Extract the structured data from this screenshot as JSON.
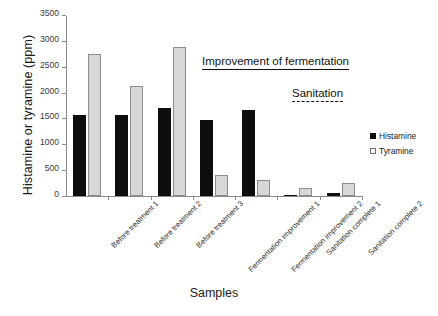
{
  "chart_data": {
    "type": "bar",
    "title": "",
    "xlabel": "Samples",
    "ylabel": "Histamine or tyramine  (ppm)",
    "ylim": [
      0,
      3500
    ],
    "ytick_step": 500,
    "yticks": [
      0,
      500,
      1000,
      1500,
      2000,
      2500,
      3000,
      3500
    ],
    "ytick_labels": [
      "0",
      "500",
      "1000",
      "1500",
      "2000",
      "2500",
      "3000",
      "3500"
    ],
    "grid": false,
    "legend_position": "right",
    "categories": [
      "Before treatment 1",
      "Before treatment 2",
      "Before treatment 3",
      "Fermentation improvement 1",
      "Fermentation improvement 2",
      "Sanitation complete 1",
      "Sanitation complete 2"
    ],
    "series": [
      {
        "name": "Histamine",
        "color": "#0d0d0d",
        "values": [
          1580,
          1580,
          1720,
          1470,
          1680,
          20,
          50
        ]
      },
      {
        "name": "Tyramine",
        "color": "#d7d7d7",
        "values": [
          2760,
          2130,
          2900,
          400,
          320,
          150,
          250
        ]
      }
    ],
    "annotations": [
      {
        "text": "Improvement of fermentation",
        "underline": "solid"
      },
      {
        "text": "Sanitation",
        "underline": "dashed"
      }
    ]
  },
  "legend": {
    "items": [
      {
        "label": "Histamine",
        "swatch": "filled"
      },
      {
        "label": "Tyramine",
        "swatch": "open"
      }
    ]
  }
}
